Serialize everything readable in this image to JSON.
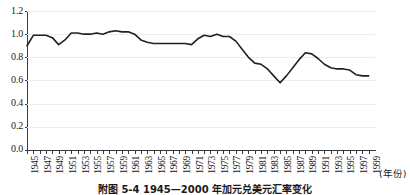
{
  "figure": {
    "caption": "附图 5-4  1945—2000 年加元兑美元汇率变化",
    "xaxis_unit_label": "(年份)"
  },
  "chart_data": {
    "type": "line",
    "title": "",
    "subtitle": "",
    "xlabel": "(年份)",
    "ylabel": "",
    "xlim": [
      1945,
      2000
    ],
    "ylim": [
      0.0,
      1.2
    ],
    "grid": true,
    "legend": false,
    "legend_position": "none",
    "ytick_labels": [
      "0.0",
      "0.2",
      "0.4",
      "0.6",
      "0.8",
      "1.0",
      "1.2"
    ],
    "ytick_values": [
      0.0,
      0.2,
      0.4,
      0.6,
      0.8,
      1.0,
      1.2
    ],
    "xtick_labels": [
      "1945",
      "1947",
      "1949",
      "1951",
      "1953",
      "1955",
      "1957",
      "1959",
      "1961",
      "1963",
      "1965",
      "1967",
      "1969",
      "1971",
      "1973",
      "1975",
      "1977",
      "1979",
      "1981",
      "1983",
      "1985",
      "1987",
      "1989",
      "1991",
      "1993",
      "1995",
      "1997",
      "1999"
    ],
    "line_color": "#231f20",
    "line_width": 1.6,
    "series": [
      {
        "name": "加元兑美元汇率",
        "x": [
          1945,
          1946,
          1947,
          1948,
          1949,
          1950,
          1951,
          1952,
          1953,
          1954,
          1955,
          1956,
          1957,
          1958,
          1959,
          1960,
          1961,
          1962,
          1963,
          1964,
          1965,
          1966,
          1967,
          1968,
          1969,
          1970,
          1971,
          1972,
          1973,
          1974,
          1975,
          1976,
          1977,
          1978,
          1979,
          1980,
          1981,
          1982,
          1983,
          1984,
          1985,
          1986,
          1987,
          1988,
          1989,
          1990,
          1991,
          1992,
          1993,
          1994,
          1995,
          1996,
          1997,
          1998,
          1999
        ],
        "y": [
          0.9,
          0.99,
          0.99,
          0.99,
          0.97,
          0.91,
          0.95,
          1.01,
          1.01,
          1.0,
          1.0,
          1.01,
          1.0,
          1.02,
          1.03,
          1.02,
          1.02,
          1.0,
          0.95,
          0.93,
          0.92,
          0.92,
          0.92,
          0.92,
          0.92,
          0.92,
          0.91,
          0.96,
          0.99,
          0.98,
          1.0,
          0.98,
          0.98,
          0.94,
          0.87,
          0.8,
          0.75,
          0.74,
          0.7,
          0.64,
          0.58,
          0.64,
          0.71,
          0.78,
          0.84,
          0.83,
          0.79,
          0.74,
          0.71,
          0.7,
          0.7,
          0.69,
          0.65,
          0.64,
          0.64
        ]
      }
    ]
  }
}
